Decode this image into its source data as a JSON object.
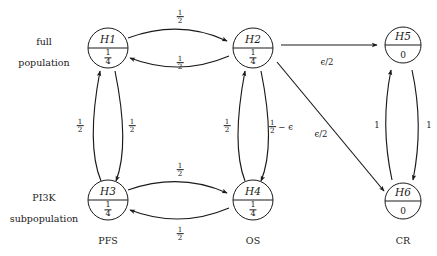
{
  "diagram": {
    "type": "state-transition-graph",
    "colors": {
      "stroke": "#1a1a1a",
      "background": "#ffffff"
    },
    "region_labels": [
      {
        "id": "full-population",
        "line1": "full",
        "line2": "population"
      },
      {
        "id": "pi3k-subpopulation",
        "line1": "PI3K",
        "line2": "subpopulation"
      }
    ],
    "column_labels": [
      {
        "id": "pfs",
        "text": "PFS"
      },
      {
        "id": "os",
        "text": "OS"
      },
      {
        "id": "cr",
        "text": "CR"
      }
    ],
    "nodes": [
      {
        "id": "H1",
        "label": "H1",
        "value_num": "1",
        "value_den": "4",
        "value_display": "1/4"
      },
      {
        "id": "H2",
        "label": "H2",
        "value_num": "1",
        "value_den": "4",
        "value_display": "1/4"
      },
      {
        "id": "H5",
        "label": "H5",
        "value_num": "",
        "value_den": "",
        "value_display": "0"
      },
      {
        "id": "H3",
        "label": "H3",
        "value_num": "1",
        "value_den": "4",
        "value_display": "1/4"
      },
      {
        "id": "H4",
        "label": "H4",
        "value_num": "1",
        "value_den": "4",
        "value_display": "1/4"
      },
      {
        "id": "H6",
        "label": "H6",
        "value_num": "",
        "value_den": "",
        "value_display": "0"
      }
    ],
    "edges": [
      {
        "id": "h1-h2",
        "from": "H1",
        "to": "H2",
        "label_num": "1",
        "label_den": "2",
        "label_display": "1/2"
      },
      {
        "id": "h2-h1",
        "from": "H2",
        "to": "H1",
        "label_num": "1",
        "label_den": "2",
        "label_display": "1/2"
      },
      {
        "id": "h3-h1",
        "from": "H3",
        "to": "H1",
        "label_num": "1",
        "label_den": "2",
        "label_display": "1/2"
      },
      {
        "id": "h1-h3",
        "from": "H1",
        "to": "H3",
        "label_num": "1",
        "label_den": "2",
        "label_display": "1/2"
      },
      {
        "id": "h3-h4",
        "from": "H3",
        "to": "H4",
        "label_num": "1",
        "label_den": "2",
        "label_display": "1/2"
      },
      {
        "id": "h4-h3",
        "from": "H4",
        "to": "H3",
        "label_num": "1",
        "label_den": "2",
        "label_display": "1/2"
      },
      {
        "id": "h4-h2",
        "from": "H4",
        "to": "H2",
        "label_num": "1",
        "label_den": "2",
        "label_display": "1/2"
      },
      {
        "id": "h2-h4",
        "from": "H2",
        "to": "H4",
        "label_num": "1",
        "label_den": "2",
        "label_suffix": " − ϵ",
        "label_display": "1/2 - ϵ"
      },
      {
        "id": "h2-h5",
        "from": "H2",
        "to": "H5",
        "label_display": "ϵ/2"
      },
      {
        "id": "h2-h6",
        "from": "H2",
        "to": "H6",
        "label_display": "ϵ/2"
      },
      {
        "id": "h6-h5",
        "from": "H6",
        "to": "H5",
        "label_display": "1"
      },
      {
        "id": "h5-h6",
        "from": "H5",
        "to": "H6",
        "label_display": "1"
      }
    ]
  }
}
